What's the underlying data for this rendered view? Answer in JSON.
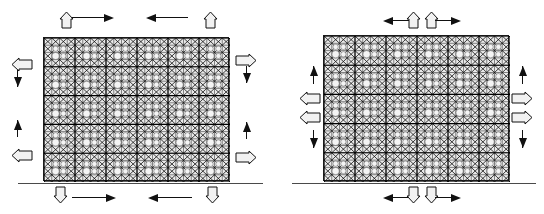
{
  "document": {
    "title": "Finite element mesh boundary condition diagram",
    "background_color": "#ffffff",
    "line_color": "#111111",
    "mesh_fill_color": "#e9e9e9",
    "hollow_arrow_fill": "#f2f2f2",
    "baseline_color": "#4a4a4a"
  },
  "figures": [
    {
      "id": "left-figure",
      "label": "Left mesh model",
      "mesh": {
        "name": "left-mesh-block",
        "x": 43,
        "y": 37,
        "width": 186,
        "height": 144,
        "columns": 6,
        "rows": 5,
        "sub_divisions": 4,
        "void_pattern": "circular holes at sub-cell centers",
        "hatch": "double diagonal cross hatch"
      },
      "baseline": {
        "name": "left-baseline",
        "x": 18,
        "y": 183,
        "width": 245
      },
      "arrows": [
        {
          "name": "top-left-prescribed-up",
          "style": "hollow",
          "direction": "up",
          "x": 59,
          "y": 12,
          "length": 16
        },
        {
          "name": "top-left-reaction-right",
          "style": "solid",
          "direction": "right",
          "x": 72,
          "y": 13,
          "length": 42
        },
        {
          "name": "top-right-reaction-left",
          "style": "solid",
          "direction": "left",
          "x": 146,
          "y": 13,
          "length": 42
        },
        {
          "name": "top-right-prescribed-up",
          "style": "hollow",
          "direction": "up",
          "x": 203,
          "y": 12,
          "length": 16
        },
        {
          "name": "left-upper-prescribed-left",
          "style": "hollow",
          "direction": "left",
          "x": 12,
          "y": 57,
          "length": 20
        },
        {
          "name": "left-upper-reaction-down",
          "style": "solid",
          "direction": "down",
          "x": 13,
          "y": 62,
          "length": 25
        },
        {
          "name": "left-lower-reaction-up",
          "style": "solid",
          "direction": "up",
          "x": 13,
          "y": 120,
          "length": 25
        },
        {
          "name": "left-lower-prescribed-left",
          "style": "hollow",
          "direction": "left",
          "x": 12,
          "y": 148,
          "length": 20
        },
        {
          "name": "right-upper-prescribed-right",
          "style": "hollow",
          "direction": "right",
          "x": 236,
          "y": 53,
          "length": 20
        },
        {
          "name": "right-upper-reaction-down",
          "style": "solid",
          "direction": "down",
          "x": 242,
          "y": 58,
          "length": 25
        },
        {
          "name": "right-lower-reaction-up",
          "style": "solid",
          "direction": "up",
          "x": 242,
          "y": 122,
          "length": 25
        },
        {
          "name": "right-lower-prescribed-right",
          "style": "hollow",
          "direction": "right",
          "x": 236,
          "y": 150,
          "length": 20
        },
        {
          "name": "bottom-left-prescribed-down",
          "style": "hollow",
          "direction": "down",
          "x": 53,
          "y": 187,
          "length": 16
        },
        {
          "name": "bottom-left-reaction-right",
          "style": "solid",
          "direction": "right",
          "x": 72,
          "y": 193,
          "length": 44
        },
        {
          "name": "bottom-right-reaction-left",
          "style": "solid",
          "direction": "left",
          "x": 148,
          "y": 193,
          "length": 44
        },
        {
          "name": "bottom-right-prescribed-down",
          "style": "hollow",
          "direction": "down",
          "x": 205,
          "y": 187,
          "length": 16
        }
      ]
    },
    {
      "id": "right-figure",
      "label": "Right mesh model",
      "mesh": {
        "name": "right-mesh-block",
        "x": 323,
        "y": 35,
        "width": 186,
        "height": 146,
        "columns": 6,
        "rows": 5,
        "sub_divisions": 4,
        "void_pattern": "circular holes at sub-cell centers",
        "hatch": "double diagonal cross hatch"
      },
      "baseline": {
        "name": "right-baseline",
        "x": 292,
        "y": 183,
        "width": 244
      },
      "arrows": [
        {
          "name": "top-reaction-left",
          "style": "solid",
          "direction": "left",
          "x": 383,
          "y": 16,
          "length": 26
        },
        {
          "name": "top-prescribed-up-left",
          "style": "hollow",
          "direction": "up",
          "x": 406,
          "y": 12,
          "length": 16
        },
        {
          "name": "top-prescribed-up-right",
          "style": "hollow",
          "direction": "up",
          "x": 424,
          "y": 12,
          "length": 16
        },
        {
          "name": "top-reaction-right",
          "style": "solid",
          "direction": "right",
          "x": 435,
          "y": 16,
          "length": 26
        },
        {
          "name": "left-reaction-up",
          "style": "solid",
          "direction": "up",
          "x": 309,
          "y": 66,
          "length": 26
        },
        {
          "name": "left-prescribed-left-upper",
          "style": "hollow",
          "direction": "left",
          "x": 300,
          "y": 91,
          "length": 20
        },
        {
          "name": "left-prescribed-left-lower",
          "style": "hollow",
          "direction": "left",
          "x": 300,
          "y": 110,
          "length": 20
        },
        {
          "name": "left-reaction-down",
          "style": "solid",
          "direction": "down",
          "x": 309,
          "y": 122,
          "length": 26
        },
        {
          "name": "right-reaction-up",
          "style": "solid",
          "direction": "up",
          "x": 518,
          "y": 66,
          "length": 26
        },
        {
          "name": "right-prescribed-right-upper",
          "style": "hollow",
          "direction": "right",
          "x": 512,
          "y": 91,
          "length": 20
        },
        {
          "name": "right-prescribed-right-lower",
          "style": "hollow",
          "direction": "right",
          "x": 512,
          "y": 110,
          "length": 20
        },
        {
          "name": "right-reaction-down",
          "style": "solid",
          "direction": "down",
          "x": 518,
          "y": 122,
          "length": 26
        },
        {
          "name": "bottom-reaction-left",
          "style": "solid",
          "direction": "left",
          "x": 383,
          "y": 193,
          "length": 26
        },
        {
          "name": "bottom-prescribed-down-left",
          "style": "hollow",
          "direction": "down",
          "x": 406,
          "y": 187,
          "length": 16
        },
        {
          "name": "bottom-prescribed-down-right",
          "style": "hollow",
          "direction": "down",
          "x": 424,
          "y": 187,
          "length": 16
        },
        {
          "name": "bottom-reaction-right",
          "style": "solid",
          "direction": "right",
          "x": 435,
          "y": 193,
          "length": 26
        }
      ]
    }
  ]
}
